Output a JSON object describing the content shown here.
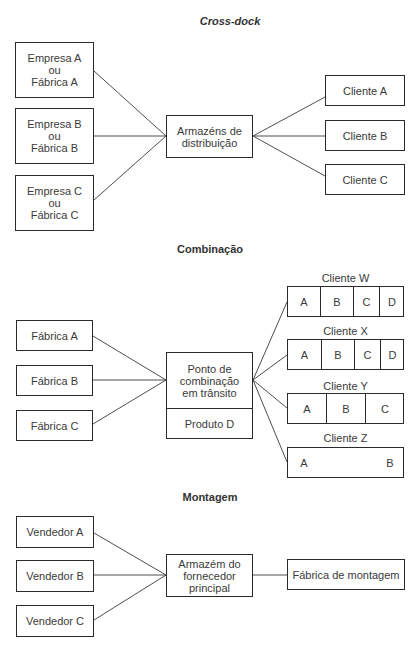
{
  "cross_dock": {
    "title": "Cross-dock",
    "sources": [
      {
        "line1": "Empresa A",
        "line2": "ou",
        "line3": "Fábrica A"
      },
      {
        "line1": "Empresa B",
        "line2": "ou",
        "line3": "Fábrica B"
      },
      {
        "line1": "Empresa C",
        "line2": "ou",
        "line3": "Fábrica C"
      }
    ],
    "hub": {
      "line1": "Armazéns de",
      "line2": "distribuição"
    },
    "clients": [
      "Cliente A",
      "Cliente B",
      "Cliente C"
    ]
  },
  "combinacao": {
    "title": "Combinação",
    "sources": [
      "Fábrica A",
      "Fábrica B",
      "Fábrica C"
    ],
    "hub": {
      "line1": "Ponto de",
      "line2": "combinação",
      "line3": "em trânsito",
      "bottom": "Produto D"
    },
    "clients": [
      {
        "label": "Cliente W",
        "cells": [
          "A",
          "B",
          "C",
          "D"
        ]
      },
      {
        "label": "Cliente X",
        "cells": [
          "A",
          "B",
          "C",
          "D"
        ]
      },
      {
        "label": "Cliente Y",
        "cells": [
          "A",
          "B",
          "C"
        ]
      },
      {
        "label": "Cliente Z",
        "cells": [
          "A",
          "B"
        ]
      }
    ]
  },
  "montagem": {
    "title": "Montagem",
    "sources": [
      "Vendedor A",
      "Vendedor B",
      "Vendedor C"
    ],
    "hub": {
      "line1": "Armazém do",
      "line2": "fornecedor",
      "line3": "principal"
    },
    "destination": "Fábrica de montagem"
  },
  "colors": {
    "line": "#2a2a2a",
    "text": "#3a3a3a",
    "background": "#ffffff"
  }
}
